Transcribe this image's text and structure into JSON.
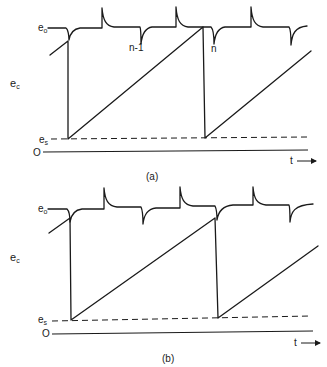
{
  "figure": {
    "panels": [
      {
        "id": "a",
        "caption": "(a)",
        "y_label": "e",
        "y_label_sub": "c",
        "level_top_label": "e",
        "level_top_sub": "o",
        "level_bottom_label": "e",
        "level_bottom_sub": "s",
        "zero_label": "O",
        "time_label": "t",
        "pulse_labels": [
          "n-1",
          "n"
        ]
      },
      {
        "id": "b",
        "caption": "(b)",
        "y_label": "e",
        "y_label_sub": "c",
        "level_top_label": "e",
        "level_top_sub": "o",
        "level_bottom_label": "e",
        "level_bottom_sub": "s",
        "zero_label": "O",
        "time_label": "t",
        "pulse_labels": []
      }
    ]
  }
}
